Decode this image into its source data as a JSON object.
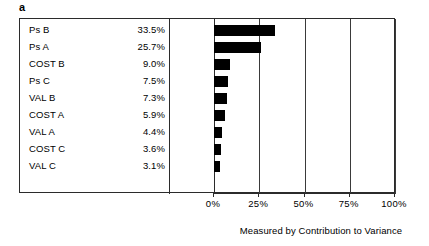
{
  "panel": {
    "letter": "a"
  },
  "chart_data": {
    "type": "bar",
    "orientation": "horizontal",
    "title": "",
    "subtitle": "",
    "xlabel": "Measured by Contribution to Variance",
    "ylabel": "",
    "xlim": [
      0,
      100
    ],
    "xticks": [
      "0%",
      "25%",
      "50%",
      "75%",
      "100%"
    ],
    "xtick_values": [
      0,
      25,
      50,
      75,
      100
    ],
    "grid": true,
    "grid_axis": "x",
    "legend": false,
    "bar_color": "#000000",
    "frame_color": "#2b2b2b",
    "categories": [
      "Ps B",
      "Ps A",
      "COST B",
      "Ps C",
      "VAL B",
      "COST A",
      "VAL A",
      "COST C",
      "VAL C"
    ],
    "values": [
      33.5,
      25.7,
      9.0,
      7.5,
      7.3,
      5.9,
      4.4,
      3.6,
      3.1
    ],
    "value_labels": [
      "33.5%",
      "25.7%",
      "9.0%",
      "7.5%",
      "7.3%",
      "5.9%",
      "4.4%",
      "3.6%",
      "3.1%"
    ],
    "rows": [
      {
        "label": "Ps B",
        "value": 33.5,
        "value_label": "33.5%"
      },
      {
        "label": "Ps A",
        "value": 25.7,
        "value_label": "25.7%"
      },
      {
        "label": "COST B",
        "value": 9.0,
        "value_label": "9.0%"
      },
      {
        "label": "Ps C",
        "value": 7.5,
        "value_label": "7.5%"
      },
      {
        "label": "VAL B",
        "value": 7.3,
        "value_label": "7.3%"
      },
      {
        "label": "COST A",
        "value": 5.9,
        "value_label": "5.9%"
      },
      {
        "label": "VAL A",
        "value": 4.4,
        "value_label": "4.4%"
      },
      {
        "label": "COST C",
        "value": 3.6,
        "value_label": "3.6%"
      },
      {
        "label": "VAL C",
        "value": 3.1,
        "value_label": "3.1%"
      }
    ]
  }
}
